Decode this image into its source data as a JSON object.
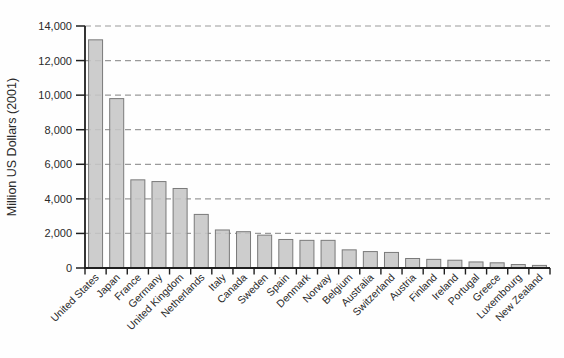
{
  "chart_data": {
    "type": "bar",
    "title": "",
    "xlabel": "",
    "ylabel": "Million US Dollars (2001)",
    "categories": [
      "United States",
      "Japan",
      "France",
      "Germany",
      "United Kingdom",
      "Netherlands",
      "Italy",
      "Canada",
      "Sweden",
      "Spain",
      "Denmark",
      "Norway",
      "Belgium",
      "Australia",
      "Switzerland",
      "Austria",
      "Finland",
      "Ireland",
      "Portugal",
      "Greece",
      "Luxembourg",
      "New Zealand"
    ],
    "values": [
      13200,
      9800,
      5100,
      5000,
      4600,
      3100,
      2200,
      2100,
      1900,
      1650,
      1600,
      1600,
      1050,
      950,
      900,
      550,
      500,
      450,
      350,
      300,
      200,
      150
    ],
    "ylim": [
      0,
      14000
    ],
    "ytick_interval": 2000,
    "ytick_labels": [
      "0",
      "2,000",
      "4,000",
      "6,000",
      "8,000",
      "10,000",
      "12,000",
      "14,000"
    ],
    "grid": "horizontal-dashed",
    "legend": "none",
    "colors": {
      "bar_fill": "#c6c6c6",
      "bar_stroke": "#7a7a7a",
      "grid_line": "#9a9a9a",
      "axis_line": "#1f1f1f",
      "text": "#2a2a2a",
      "background": "#fefefe"
    }
  }
}
